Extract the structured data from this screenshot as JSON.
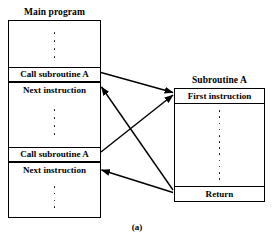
{
  "figure": {
    "caption": "(a)",
    "line_color": "#000000",
    "background_color": "#ffffff"
  },
  "main_program": {
    "title": "Main program",
    "rows": [
      {
        "type": "dots",
        "count": 4
      },
      {
        "type": "label",
        "text": "Call subroutine A"
      },
      {
        "type": "label",
        "text": "Next instruction"
      },
      {
        "type": "dots",
        "count": 4
      },
      {
        "type": "label",
        "text": "Call subroutine A"
      },
      {
        "type": "label",
        "text": "Next instruction"
      },
      {
        "type": "dots",
        "count": 4
      }
    ],
    "call_1_label": "Call subroutine A",
    "next_1_label": "Next instruction",
    "call_2_label": "Call subroutine A",
    "next_2_label": "Next instruction"
  },
  "subroutine": {
    "title": "Subroutine A",
    "first_instruction_label": "First instruction",
    "return_label": "Return",
    "dots_count": 12
  },
  "arrows": [
    {
      "name": "call-1-to-first-instruction",
      "from": "Call subroutine A (1)",
      "to": "First instruction",
      "direction": "right"
    },
    {
      "name": "call-2-to-first-instruction",
      "from": "Call subroutine A (2)",
      "to": "First instruction",
      "direction": "right"
    },
    {
      "name": "return-to-next-instruction-1",
      "from": "Return",
      "to": "Next instruction (1)",
      "direction": "left"
    },
    {
      "name": "return-to-next-instruction-2",
      "from": "Return",
      "to": "Next instruction (2)",
      "direction": "left"
    }
  ]
}
